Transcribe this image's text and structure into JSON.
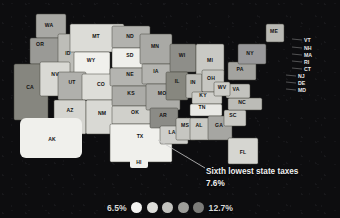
{
  "chart_data": {
    "type": "heatmap",
    "title": "",
    "subtitle": "",
    "annotation": {
      "label": "Sixth lowest state taxes",
      "value": "7.6%",
      "target_state": "TX"
    },
    "legend": {
      "position": "bottom-center",
      "min_label": "6.5%",
      "max_label": "12.7%",
      "swatches": [
        "#f3f3f1",
        "#dededa",
        "#c3c3bf",
        "#9e9e9a",
        "#7c7c79"
      ]
    },
    "unit": "%",
    "value_range": [
      6.5,
      12.7
    ],
    "regions": [
      {
        "code": "WA",
        "x": 49,
        "y": 27,
        "fill": "#a8a8a4"
      },
      {
        "code": "OR",
        "x": 40,
        "y": 46,
        "fill": "#9a9a96"
      },
      {
        "code": "CA",
        "x": 30,
        "y": 89,
        "fill": "#86867f"
      },
      {
        "code": "ID",
        "x": 68,
        "y": 55,
        "fill": "#bdbdb8"
      },
      {
        "code": "NV",
        "x": 55,
        "y": 76,
        "fill": "#d9d9d4"
      },
      {
        "code": "MT",
        "x": 96,
        "y": 38,
        "fill": "#dcdcd7"
      },
      {
        "code": "WY",
        "x": 91,
        "y": 62,
        "fill": "#f0f0ec"
      },
      {
        "code": "UT",
        "x": 72,
        "y": 84,
        "fill": "#b0b0ac"
      },
      {
        "code": "CO",
        "x": 101,
        "y": 86,
        "fill": "#dedeD9"
      },
      {
        "code": "AZ",
        "x": 70,
        "y": 112,
        "fill": "#d5d5d0"
      },
      {
        "code": "NM",
        "x": 102,
        "y": 115,
        "fill": "#d9d9d4"
      },
      {
        "code": "ND",
        "x": 130,
        "y": 38,
        "fill": "#b2b2ae"
      },
      {
        "code": "SD",
        "x": 130,
        "y": 57,
        "fill": "#efefeb"
      },
      {
        "code": "NE",
        "x": 130,
        "y": 76,
        "fill": "#b4b4b0"
      },
      {
        "code": "KS",
        "x": 131,
        "y": 95,
        "fill": "#ababa7"
      },
      {
        "code": "OK",
        "x": 135,
        "y": 114,
        "fill": "#d0d0cb"
      },
      {
        "code": "TX",
        "x": 140,
        "y": 138,
        "fill": "#f0f0ec"
      },
      {
        "code": "MN",
        "x": 155,
        "y": 48,
        "fill": "#a9a9a5"
      },
      {
        "code": "IA",
        "x": 156,
        "y": 73,
        "fill": "#b4b4b0"
      },
      {
        "code": "MO",
        "x": 162,
        "y": 95,
        "fill": "#acaca8"
      },
      {
        "code": "AR",
        "x": 163,
        "y": 117,
        "fill": "#8b8b86"
      },
      {
        "code": "LA",
        "x": 172,
        "y": 134,
        "fill": "#cececa"
      },
      {
        "code": "WI",
        "x": 182,
        "y": 57,
        "fill": "#8e8e89"
      },
      {
        "code": "IL",
        "x": 177,
        "y": 83,
        "fill": "#87877f"
      },
      {
        "code": "MS",
        "x": 185,
        "y": 127,
        "fill": "#c6c6c1"
      },
      {
        "code": "AL",
        "x": 199,
        "y": 127,
        "fill": "#c9c9c4"
      },
      {
        "code": "MI",
        "x": 210,
        "y": 62,
        "fill": "#c9c9c4"
      },
      {
        "code": "IN",
        "x": 193,
        "y": 84,
        "fill": "#bcbcb7"
      },
      {
        "code": "OH",
        "x": 211,
        "y": 80,
        "fill": "#c6c6c1"
      },
      {
        "code": "KY",
        "x": 203,
        "y": 97,
        "fill": "#cfcfca"
      },
      {
        "code": "TN",
        "x": 202,
        "y": 109,
        "fill": "#e9e9e5"
      },
      {
        "code": "GA",
        "x": 219,
        "y": 127,
        "fill": "#a6a6a2"
      },
      {
        "code": "FL",
        "x": 243,
        "y": 154,
        "fill": "#d6d6d1"
      },
      {
        "code": "SC",
        "x": 233,
        "y": 117,
        "fill": "#c9c9c4"
      },
      {
        "code": "NC",
        "x": 242,
        "y": 104,
        "fill": "#bcbcb7"
      },
      {
        "code": "VA",
        "x": 236,
        "y": 91,
        "fill": "#c3c3be"
      },
      {
        "code": "WV",
        "x": 222,
        "y": 89,
        "fill": "#cdcdc8"
      },
      {
        "code": "PA",
        "x": 240,
        "y": 71,
        "fill": "#a3a39f"
      },
      {
        "code": "NY",
        "x": 250,
        "y": 55,
        "fill": "#98989a"
      },
      {
        "code": "ME",
        "x": 274,
        "y": 33,
        "fill": "#b9b9b4"
      }
    ],
    "callout_labels": [
      {
        "code": "VT",
        "x": 304,
        "y": 42
      },
      {
        "code": "NH",
        "x": 304,
        "y": 50
      },
      {
        "code": "MA",
        "x": 304,
        "y": 57
      },
      {
        "code": "RI",
        "x": 304,
        "y": 64
      },
      {
        "code": "CT",
        "x": 304,
        "y": 71
      },
      {
        "code": "NJ",
        "x": 298,
        "y": 78
      },
      {
        "code": "DE",
        "x": 298,
        "y": 85
      },
      {
        "code": "MD",
        "x": 298,
        "y": 92
      }
    ],
    "inset_labels": [
      {
        "code": "AK",
        "x": 52,
        "y": 141
      },
      {
        "code": "HI",
        "x": 139,
        "y": 164
      }
    ]
  }
}
